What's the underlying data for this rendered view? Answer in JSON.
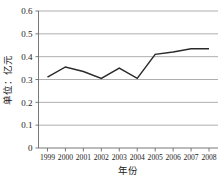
{
  "chart_data": {
    "type": "line",
    "title": "",
    "xlabel": "年份",
    "ylabel": "单位：亿元",
    "categories": [
      "1999",
      "2000",
      "2001",
      "2002",
      "2003",
      "2004",
      "2005",
      "2006",
      "2007",
      "2008"
    ],
    "values": [
      0.31,
      0.355,
      0.335,
      0.305,
      0.35,
      0.305,
      0.41,
      0.42,
      0.435,
      0.435
    ],
    "series": [
      {
        "name": "",
        "values": [
          0.31,
          0.355,
          0.335,
          0.305,
          0.35,
          0.305,
          0.41,
          0.42,
          0.435,
          0.435
        ]
      }
    ],
    "ylim": [
      0,
      0.6
    ],
    "ytick_labels": [
      "0",
      "0.1",
      "0.2",
      "0.3",
      "0.4",
      "0.5",
      "0.6"
    ],
    "ytick_values": [
      0,
      0.1,
      0.2,
      0.3,
      0.4,
      0.5,
      0.6
    ],
    "grid": true,
    "grid_axis": "y",
    "legend": false,
    "legend_position": "none",
    "line_color": "#2b2b2b",
    "grid_color": "#9a9a9a",
    "axis_color": "#6a6a6a",
    "background_color": "#ffffff",
    "markers": false
  }
}
